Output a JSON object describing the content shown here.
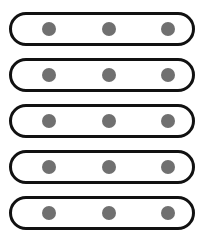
{
  "diagram": {
    "border_color": "#111111",
    "dot_color": "#707070",
    "background": "#ffffff",
    "rows": [
      {
        "dots": 3
      },
      {
        "dots": 3
      },
      {
        "dots": 3
      },
      {
        "dots": 3
      },
      {
        "dots": 3
      }
    ]
  }
}
